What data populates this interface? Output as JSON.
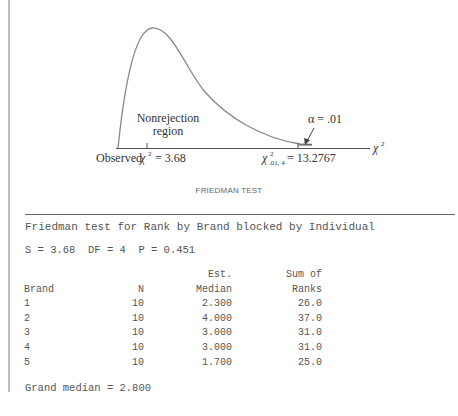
{
  "figure": {
    "observed_label": "Observed",
    "observed_value": "= 3.68",
    "critical_value": "= 13.2767",
    "critical_subscript": ".01, 4",
    "alpha_label": "α = .01",
    "nonrejection_line1": "Nonrejection",
    "nonrejection_line2": "region",
    "axis_label": "χ",
    "axis_exponent": "2",
    "chi_symbol": "χ"
  },
  "caption": "FRIEDMAN TEST",
  "output": {
    "title": "Friedman test for Rank by Brand blocked by Individual",
    "stats": "S = 3.68  DF = 4  P = 0.451",
    "headers_top": [
      "",
      "",
      "Est.",
      "Sum of"
    ],
    "headers": [
      "Brand",
      "N",
      "Median",
      "Ranks"
    ],
    "rows": [
      {
        "brand": "1",
        "n": "10",
        "median": "2.300",
        "ranks": "26.0"
      },
      {
        "brand": "2",
        "n": "10",
        "median": "4.000",
        "ranks": "37.0"
      },
      {
        "brand": "3",
        "n": "10",
        "median": "3.000",
        "ranks": "31.0"
      },
      {
        "brand": "4",
        "n": "10",
        "median": "3.000",
        "ranks": "31.0"
      },
      {
        "brand": "5",
        "n": "10",
        "median": "1.700",
        "ranks": "25.0"
      }
    ],
    "grand_median": "Grand median = 2.800"
  }
}
